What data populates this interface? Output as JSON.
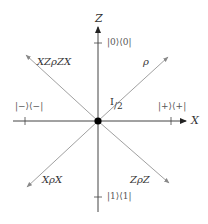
{
  "diagram": {
    "axes": {
      "z_label": "Z",
      "x_label": "X"
    },
    "ticks": {
      "top": "|0⟩⟨0|",
      "bottom": "|1⟩⟨1|",
      "left": "|−⟩⟨−|",
      "right": "|+⟩⟨+|"
    },
    "center_label": "I",
    "center_label_sub": "/2",
    "vectors": [
      {
        "label": "ρ",
        "direction": "upper-right"
      },
      {
        "label": "XZρZX",
        "direction": "upper-left"
      },
      {
        "label": "XρX",
        "direction": "lower-left"
      },
      {
        "label": "ZρZ",
        "direction": "lower-right"
      }
    ],
    "colors": {
      "axis": "#333333",
      "vector": "#888888",
      "origin": "#000000",
      "text": "#333333"
    }
  }
}
